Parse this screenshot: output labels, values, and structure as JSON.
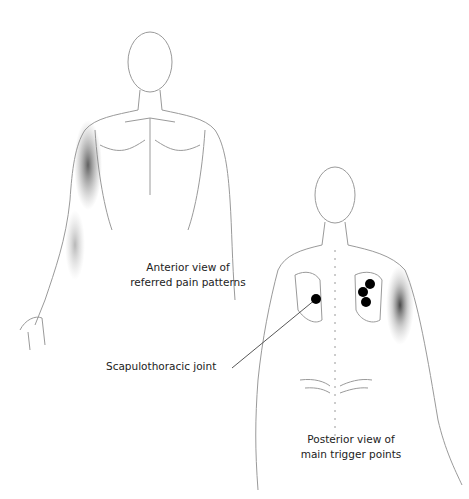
{
  "labels": {
    "anterior": {
      "line1": "Anterior view of",
      "line2": "referred pain patterns"
    },
    "joint": "Scapulothoracic joint",
    "posterior": {
      "line1": "Posterior view of",
      "line2": "main trigger points"
    }
  },
  "colors": {
    "outline": "#9a9a9a",
    "pain_shade": "#555555",
    "trigger_point": "#000000",
    "text": "#222222"
  },
  "trigger_points": [
    {
      "x": 316,
      "y": 299
    },
    {
      "x": 370,
      "y": 284
    },
    {
      "x": 363,
      "y": 292
    },
    {
      "x": 366,
      "y": 302
    }
  ]
}
